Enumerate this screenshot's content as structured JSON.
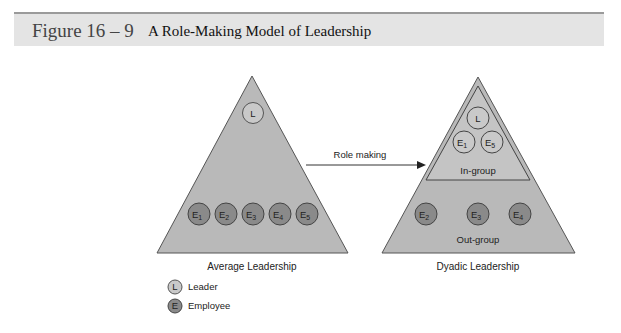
{
  "header": {
    "figure_number": "Figure 16 – 9",
    "title": "A Role-Making Model of Leadership"
  },
  "arrow": {
    "label": "Role making"
  },
  "average": {
    "caption": "Average Leadership",
    "leader": "L",
    "employees": [
      "E1",
      "E2",
      "E3",
      "E4",
      "E5"
    ]
  },
  "dyadic": {
    "caption": "Dyadic Leadership",
    "in_group_label": "In-group",
    "out_group_label": "Out-group",
    "in_group": [
      "L",
      "E1",
      "E5"
    ],
    "out_group": [
      "E2",
      "E3",
      "E4"
    ]
  },
  "legend": {
    "leader_symbol": "L",
    "leader_label": "Leader",
    "employee_symbol": "E",
    "employee_label": "Employee"
  },
  "colors": {
    "triangle": "#b9b9b9",
    "employee": "#8a8a8a",
    "leader": "#c9c9c9",
    "header": "#e4e4e4"
  }
}
